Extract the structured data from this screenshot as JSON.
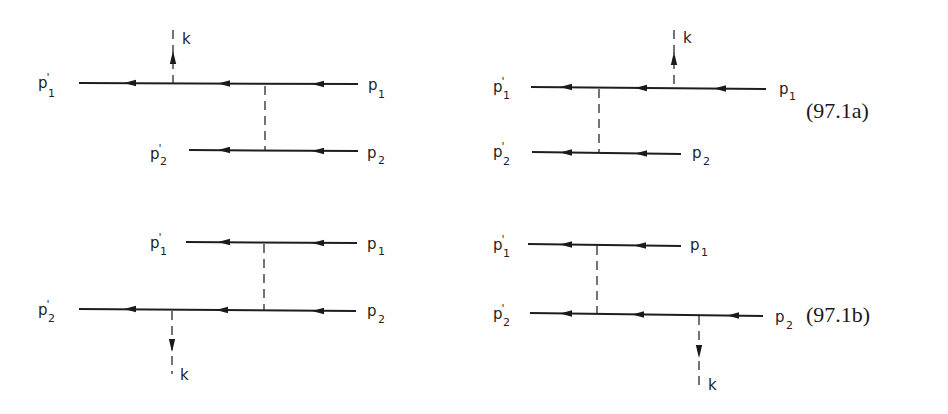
{
  "figure": {
    "equations": {
      "a": "(97.1a)",
      "b": "(97.1b)"
    },
    "diagrams": [
      {
        "id": "a-left",
        "labels": {
          "p1_out": "p",
          "p1_out_sub": "1",
          "p2_out": "p",
          "p2_out_sub": "2",
          "p1_in": "p",
          "p1_in_sub": "1",
          "p2_in": "p",
          "p2_in_sub": "2",
          "photon": "k"
        },
        "photon_emitted_from": "line-1",
        "photon_direction": "up"
      },
      {
        "id": "a-right",
        "labels": {
          "p1_out": "p",
          "p1_out_sub": "1",
          "p2_out": "p",
          "p2_out_sub": "2",
          "p1_in": "p",
          "p1_in_sub": "1",
          "p2_in": "p",
          "p2_in_sub": "2",
          "photon": "k"
        },
        "photon_emitted_from": "line-1",
        "photon_direction": "up"
      },
      {
        "id": "b-left",
        "labels": {
          "p1_out": "p",
          "p1_out_sub": "1",
          "p2_out": "p",
          "p2_out_sub": "2",
          "p1_in": "p",
          "p1_in_sub": "1",
          "p2_in": "p",
          "p2_in_sub": "2",
          "photon": "k"
        },
        "photon_emitted_from": "line-2",
        "photon_direction": "down"
      },
      {
        "id": "b-right",
        "labels": {
          "p1_out": "p",
          "p1_out_sub": "1",
          "p2_out": "p",
          "p2_out_sub": "2",
          "p1_in": "p",
          "p1_in_sub": "1",
          "p2_in": "p",
          "p2_in_sub": "2",
          "photon": "k"
        },
        "photon_emitted_from": "line-2",
        "photon_direction": "down"
      }
    ],
    "prime": "'",
    "colors": {
      "ink": "#1e1e1e",
      "background": "#ffffff"
    }
  }
}
